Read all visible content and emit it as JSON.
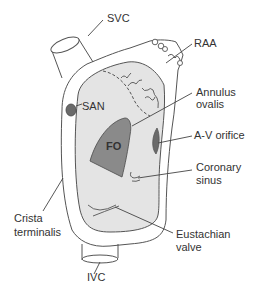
{
  "diagram": {
    "colors": {
      "outline": "#555555",
      "interior_fill": "#e4e4e4",
      "fo_fill": "#8a8a8a",
      "san_fill": "#6a6a6a",
      "av_fill": "#6a6a6a",
      "text": "#333333"
    },
    "labels": {
      "svc": "SVC",
      "raa": "RAA",
      "annulus_line1": "Annulus",
      "annulus_line2": "ovalis",
      "san": "SAN",
      "av_orifice": "A-V orifice",
      "fo": "FO",
      "coronary_line1": "Coronary",
      "coronary_line2": "sinus",
      "crista_line1": "Crista",
      "crista_line2": "terminalis",
      "eustachian_line1": "Eustachian",
      "eustachian_line2": "valve",
      "ivc": "IVC"
    }
  }
}
